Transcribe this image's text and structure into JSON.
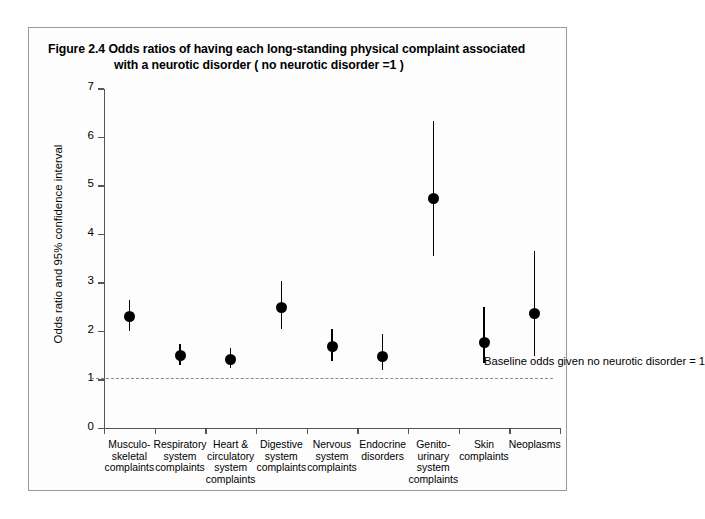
{
  "figure": {
    "title_line1": "Figure 2.4  Odds ratios of having each long-standing physical complaint associated",
    "title_line2": "with a neurotic disorder ( no neurotic disorder =1 )",
    "baseline_note": "Baseline\nodds given\nno neurotic\ndisorder = 1"
  },
  "chart_data": {
    "type": "scatter",
    "title": "Figure 2.4  Odds ratios of having each long-standing physical complaint associated with a neurotic disorder ( no neurotic disorder =1 )",
    "xlabel": "",
    "ylabel": "Odds ratio and 95% confidence interval",
    "ylim": [
      0,
      7
    ],
    "yticks": [
      0,
      1,
      2,
      3,
      4,
      5,
      6,
      7
    ],
    "ytick_labels": [
      "0",
      "1",
      "2",
      "3",
      "4",
      "5",
      "6",
      "7"
    ],
    "grid": false,
    "legend": "none",
    "reference_line": {
      "value": 1,
      "style": "dash-dot",
      "label": "Baseline odds given no neurotic disorder = 1"
    },
    "categories": [
      "Musculo-\nskeletal\ncomplaints",
      "Respiratory\nsystem\ncomplaints",
      "Heart &\ncirculatory\nsystem\ncomplaints",
      "Digestive\nsystem\ncomplaints",
      "Nervous\nsystem\ncomplaints",
      "Endocrine\ndisorders",
      "Genito-\nurinary\nsystem\ncomplaints",
      "Skin\ncomplaints",
      "Neoplasms"
    ],
    "values": [
      2.3,
      1.5,
      1.42,
      2.5,
      1.7,
      1.48,
      4.75,
      1.78,
      2.37
    ],
    "ci_lower": [
      2.0,
      1.3,
      1.25,
      2.05,
      1.4,
      1.2,
      3.55,
      1.35,
      1.5
    ],
    "ci_upper": [
      2.65,
      1.75,
      1.65,
      3.05,
      2.05,
      1.95,
      6.35,
      2.5,
      3.65
    ]
  }
}
